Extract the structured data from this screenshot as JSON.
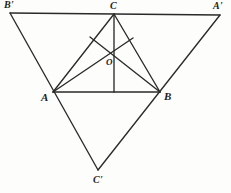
{
  "figure": {
    "background_color": "#fdfdfb",
    "stroke_color": "#2a2a2a",
    "labels": {
      "A": "A",
      "B": "B",
      "C": "C",
      "A_prime": "A'",
      "B_prime": "B'",
      "C_prime": "C'",
      "O": "O"
    },
    "points": {
      "A": {
        "x": 53,
        "y": 92
      },
      "B": {
        "x": 160,
        "y": 92
      },
      "C": {
        "x": 114,
        "y": 14
      },
      "A_prime": {
        "x": 220,
        "y": 15
      },
      "B_prime": {
        "x": 10,
        "y": 13
      },
      "C_prime": {
        "x": 98,
        "y": 170
      },
      "O": {
        "x": 114,
        "y": 54
      },
      "P_left": {
        "x": 90,
        "y": 37
      },
      "P_right": {
        "x": 133,
        "y": 38
      }
    },
    "label_positions": {
      "A": {
        "x": 41,
        "y": 92
      },
      "B": {
        "x": 164,
        "y": 91
      },
      "C": {
        "x": 110,
        "y": 1
      },
      "A_prime": {
        "x": 213,
        "y": 1
      },
      "B_prime": {
        "x": 4,
        "y": 0
      },
      "C_prime": {
        "x": 93,
        "y": 175
      },
      "O": {
        "x": 106,
        "y": 58
      }
    },
    "segments": [
      {
        "name": "outer-top-edge-Bprime-Aprime",
        "from": "B_prime",
        "to": "A_prime"
      },
      {
        "name": "outer-left-edge-Bprime-Cprime",
        "from": "B_prime",
        "to": "C_prime"
      },
      {
        "name": "outer-right-edge-Aprime-Cprime",
        "from": "A_prime",
        "to": "C_prime"
      },
      {
        "name": "inner-base-A-B",
        "from": "A",
        "to": "B"
      },
      {
        "name": "inner-left-A-C",
        "from": "A",
        "to": "C"
      },
      {
        "name": "inner-right-B-C",
        "from": "B",
        "to": "C"
      },
      {
        "name": "median-C-to-base",
        "from": "C",
        "to": "foot"
      },
      {
        "name": "cevian-A-to-O-extended",
        "from": "A",
        "to": "P_right"
      },
      {
        "name": "cevian-B-to-O-extended",
        "from": "B",
        "to": "P_left"
      }
    ],
    "foot_of_altitude": {
      "x": 114,
      "y": 92
    }
  }
}
